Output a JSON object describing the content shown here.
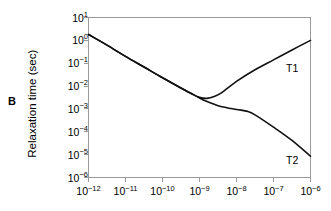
{
  "panel": {
    "letter": "B"
  },
  "chart_data": {
    "type": "line",
    "title": "",
    "subtitle": "",
    "xlabel": "",
    "ylabel": "Relaxation time (sec)",
    "xscale": "log",
    "yscale": "log",
    "xlim": [
      1e-12,
      1e-06
    ],
    "ylim": [
      1e-06,
      10.0
    ],
    "grid": false,
    "legend_position": "inline-right",
    "xticks": [
      1e-12,
      1e-11,
      1e-10,
      1e-09,
      1e-08,
      1e-07,
      1e-06
    ],
    "xtick_labels": [
      "10-12",
      "10-11",
      "10-10",
      "10-9",
      "10-8",
      "10-7",
      "10-6"
    ],
    "xtick_mantissa": "10",
    "xtick_exponents": [
      "-12",
      "-11",
      "-10",
      "-9",
      "-8",
      "-7",
      "-6"
    ],
    "yticks": [
      10.0,
      1.0,
      0.1,
      0.01,
      0.001,
      0.0001,
      1e-05,
      1e-06
    ],
    "ytick_mantissa": "10",
    "ytick_exponents": [
      "1",
      "0",
      "-1",
      "-2",
      "-3",
      "-4",
      "-5",
      "-6"
    ],
    "line_color": "#111111",
    "axis_color": "#9a9a9a",
    "series": [
      {
        "name": "T1",
        "label": "T1",
        "x": [
          1e-12,
          3.16e-12,
          1e-11,
          3.16e-11,
          1e-10,
          3.16e-10,
          6e-10,
          1e-09,
          1.6e-09,
          2.5e-09,
          4e-09,
          1e-08,
          3.16e-08,
          1e-07,
          3.16e-07,
          1e-06
        ],
        "y": [
          1.8,
          0.62,
          0.2,
          0.068,
          0.023,
          0.0082,
          0.0047,
          0.0032,
          0.0029,
          0.0035,
          0.0052,
          0.016,
          0.052,
          0.14,
          0.38,
          1.0
        ]
      },
      {
        "name": "T2",
        "label": "T2",
        "x": [
          1e-12,
          3.16e-12,
          1e-11,
          3.16e-11,
          1e-10,
          3.16e-10,
          6e-10,
          1e-09,
          1.6e-09,
          2.5e-09,
          4e-09,
          1e-08,
          2e-08,
          3.16e-08,
          1e-07,
          3.16e-07,
          1e-06
        ],
        "y": [
          1.8,
          0.62,
          0.2,
          0.068,
          0.023,
          0.0082,
          0.0047,
          0.003,
          0.0021,
          0.0016,
          0.00125,
          0.00095,
          0.00078,
          0.00055,
          0.00016,
          4.2e-05,
          8.5e-06
        ]
      }
    ]
  }
}
